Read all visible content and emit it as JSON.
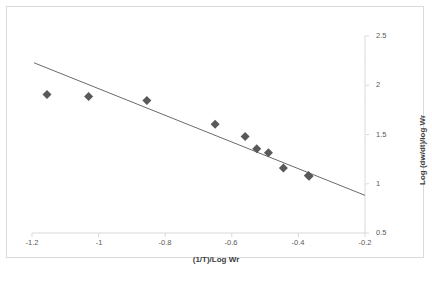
{
  "chart_data": {
    "type": "scatter",
    "title": "",
    "xlabel": "(1/T)/Log Wr",
    "ylabel": "Log (dw/dt)/log Wr",
    "xlim": [
      -1.2,
      -0.2
    ],
    "ylim": [
      0.5,
      2.5
    ],
    "xticks": [
      "-1.2",
      "-1",
      "-0.8",
      "-0.6",
      "-0.4",
      "-0.2"
    ],
    "xtick_values": [
      -1.2,
      -1.0,
      -0.8,
      -0.6,
      -0.4,
      -0.2
    ],
    "yticks": [
      "0.5",
      "1",
      "1.5",
      "2",
      "2.5"
    ],
    "ytick_values": [
      0.5,
      1.0,
      1.5,
      2.0,
      2.5
    ],
    "y_axis_position": "right",
    "grid": false,
    "legend": "none",
    "marker": "diamond",
    "marker_color": "#595959",
    "marker_size": 9,
    "line_color": "#595959",
    "points": [
      {
        "x": -1.155,
        "y": 1.905
      },
      {
        "x": -1.03,
        "y": 1.885
      },
      {
        "x": -0.855,
        "y": 1.845
      },
      {
        "x": -0.65,
        "y": 1.605
      },
      {
        "x": -0.56,
        "y": 1.48
      },
      {
        "x": -0.525,
        "y": 1.355
      },
      {
        "x": -0.49,
        "y": 1.315
      },
      {
        "x": -0.445,
        "y": 1.16
      },
      {
        "x": -0.37,
        "y": 1.085
      },
      {
        "x": -0.368,
        "y": 1.075
      }
    ],
    "trendline": {
      "type": "linear",
      "x_start": -1.194,
      "y_start": 2.228,
      "x_end": -0.2,
      "y_end": 0.882,
      "slope": -1.354,
      "intercept": 0.611
    }
  },
  "footer": {
    "note": ""
  }
}
